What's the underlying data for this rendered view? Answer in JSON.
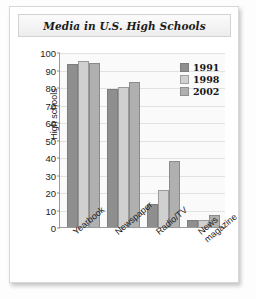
{
  "card": {
    "title": "Media in U.S. High Schools"
  },
  "chart_data": {
    "type": "bar",
    "title": "Media in U.S. High Schools",
    "xlabel": "",
    "ylabel": "High schools",
    "categories": [
      "Yearbook",
      "Newspaper",
      "Radio/TV",
      "News\nmagazine"
    ],
    "series": [
      {
        "name": "1991",
        "color": "#8f8f8f",
        "values": [
          93,
          79,
          13,
          4
        ]
      },
      {
        "name": "1998",
        "color": "#d0d0d0",
        "values": [
          95,
          80,
          21,
          4
        ]
      },
      {
        "name": "2002",
        "color": "#b0b0b0",
        "values": [
          94,
          83,
          38,
          7
        ]
      }
    ],
    "ylim": [
      0,
      100
    ],
    "yticks": [
      0,
      10,
      20,
      30,
      40,
      50,
      60,
      70,
      80,
      90,
      100
    ],
    "grid": true,
    "legend_position": "inside-top-right"
  }
}
